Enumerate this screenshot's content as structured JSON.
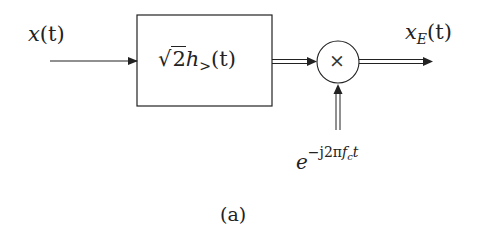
{
  "diagram": {
    "type": "block-diagram",
    "input": {
      "var": "x",
      "arg": "(t)"
    },
    "block": {
      "sqrt": "√",
      "coef": "2",
      "h": "h",
      "sub": ">",
      "arg": "(t)"
    },
    "multiplier": {
      "symbol": "×"
    },
    "carrier": {
      "base": "e",
      "exponent_pre": "−j2π",
      "f": "f",
      "f_sub": "c",
      "t": "t"
    },
    "output": {
      "var": "x",
      "sub": "E",
      "arg": "(t)"
    },
    "caption": "(a)"
  },
  "colors": {
    "stroke": "#222222",
    "background": "#ffffff"
  }
}
